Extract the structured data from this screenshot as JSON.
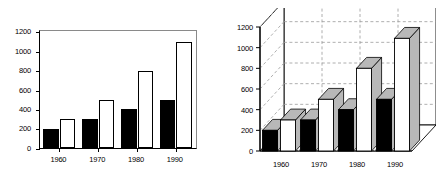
{
  "figure": {
    "background": "#ffffff",
    "series_colors": {
      "series1": "#000000",
      "series2": "#ffffff",
      "bar_3d_shade": "#b8b8b8",
      "axis": "#000000",
      "grid": "#9a9a9a"
    }
  },
  "chart_data": [
    {
      "type": "bar",
      "id": "chart-2d",
      "style": "2d-grouped-vertical-bar",
      "title": "",
      "xlabel": "",
      "ylabel": "",
      "categories": [
        "1960",
        "1970",
        "1980",
        "1990"
      ],
      "series": [
        {
          "name": "series-1",
          "color": "#000000",
          "fill": "solid-black",
          "values": [
            200,
            300,
            400,
            500
          ]
        },
        {
          "name": "series-2",
          "color": "#ffffff",
          "fill": "white-outlined",
          "values": [
            300,
            500,
            800,
            1090
          ]
        }
      ],
      "ylim": [
        0,
        1200
      ],
      "yticks": [
        0,
        200,
        400,
        600,
        800,
        1000,
        1200
      ],
      "ytick_labels": [
        "0",
        "200",
        "400",
        "600",
        "800",
        "1000",
        "1200"
      ],
      "xtick_labels": [
        "1960",
        "1970",
        "1980",
        "1990"
      ],
      "grid": false,
      "legend": "none"
    },
    {
      "type": "bar",
      "id": "chart-3d",
      "style": "3d-grouped-vertical-bar",
      "title": "",
      "xlabel": "",
      "ylabel": "",
      "categories": [
        "1960",
        "1970",
        "1980",
        "1990"
      ],
      "series": [
        {
          "name": "series-1",
          "color": "#000000",
          "fill": "solid-black",
          "values": [
            200,
            300,
            400,
            500
          ]
        },
        {
          "name": "series-2",
          "color": "#ffffff",
          "fill": "white-with-gray-shading",
          "values": [
            300,
            500,
            800,
            1090
          ]
        }
      ],
      "ylim": [
        0,
        1200
      ],
      "yticks": [
        0,
        200,
        400,
        600,
        800,
        1000,
        1200
      ],
      "ytick_labels": [
        "0",
        "200",
        "400",
        "600",
        "800",
        "1000",
        "1200"
      ],
      "xtick_labels": [
        "1960",
        "1970",
        "1980",
        "1990"
      ],
      "grid": true,
      "grid_style": "dashed",
      "legend": "none"
    }
  ]
}
